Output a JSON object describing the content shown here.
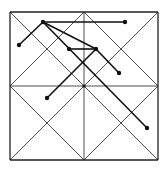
{
  "diagram": {
    "title": "",
    "frame": {
      "x1": 10,
      "y1": 12,
      "x2": 158,
      "y2": 160
    },
    "grid_lines": [
      [
        10,
        12,
        158,
        12
      ],
      [
        158,
        12,
        158,
        160
      ],
      [
        158,
        160,
        10,
        160
      ],
      [
        10,
        160,
        10,
        12
      ],
      [
        84,
        12,
        84,
        160
      ],
      [
        10,
        86,
        158,
        86
      ],
      [
        10,
        12,
        158,
        160
      ],
      [
        158,
        12,
        10,
        160
      ],
      [
        84,
        12,
        158,
        86
      ],
      [
        158,
        86,
        84,
        160
      ],
      [
        84,
        160,
        10,
        86
      ],
      [
        10,
        86,
        84,
        12
      ]
    ],
    "points": [
      {
        "id": "A",
        "x": 43,
        "y": 22
      },
      {
        "id": "B",
        "x": 125,
        "y": 22
      },
      {
        "id": "C",
        "x": 19,
        "y": 45
      },
      {
        "id": "D",
        "x": 69,
        "y": 49
      },
      {
        "id": "E",
        "x": 96,
        "y": 49
      },
      {
        "id": "F",
        "x": 119,
        "y": 73
      },
      {
        "id": "G",
        "x": 47,
        "y": 98
      },
      {
        "id": "H",
        "x": 147,
        "y": 128
      },
      {
        "id": "O",
        "x": 84,
        "y": 86
      }
    ],
    "segments": [
      [
        "A",
        "B"
      ],
      [
        "A",
        "C"
      ],
      [
        "A",
        "E"
      ],
      [
        "A",
        "H"
      ],
      [
        "D",
        "E"
      ],
      [
        "E",
        "F"
      ],
      [
        "E",
        "G"
      ]
    ],
    "colors": {
      "grid": "#222222",
      "path": "#111111",
      "background": "#ffffff"
    }
  }
}
